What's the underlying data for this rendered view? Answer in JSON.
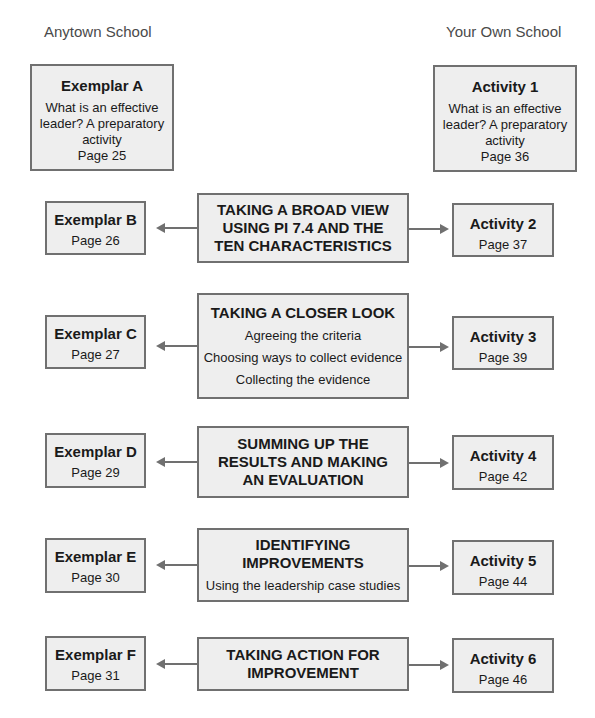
{
  "headers": {
    "left": "Anytown School",
    "right": "Your Own School"
  },
  "top": {
    "left": {
      "title": "Exemplar A",
      "lines": [
        "What is an effective",
        "leader? A preparatory",
        "activity",
        "Page 25"
      ]
    },
    "right": {
      "title": "Activity 1",
      "lines": [
        "What is an effective",
        "leader? A preparatory",
        "activity",
        "Page 36"
      ]
    }
  },
  "rows": [
    {
      "left": {
        "title": "Exemplar B",
        "page": "Page 26"
      },
      "center": {
        "title": [
          "TAKING A BROAD VIEW",
          "USING PI 7.4 AND THE",
          "TEN CHARACTERISTICS"
        ],
        "sub": []
      },
      "right": {
        "title": "Activity 2",
        "page": "Page 37"
      }
    },
    {
      "left": {
        "title": "Exemplar C",
        "page": "Page 27"
      },
      "center": {
        "title": [
          "TAKING A CLOSER LOOK"
        ],
        "sub": [
          "Agreeing the criteria",
          "Choosing ways to collect evidence",
          "Collecting the evidence"
        ]
      },
      "right": {
        "title": "Activity 3",
        "page": "Page 39"
      }
    },
    {
      "left": {
        "title": "Exemplar D",
        "page": "Page 29"
      },
      "center": {
        "title": [
          "SUMMING UP THE",
          "RESULTS AND MAKING",
          "AN EVALUATION"
        ],
        "sub": []
      },
      "right": {
        "title": "Activity 4",
        "page": "Page 42"
      }
    },
    {
      "left": {
        "title": "Exemplar E",
        "page": "Page 30"
      },
      "center": {
        "title": [
          "IDENTIFYING",
          "IMPROVEMENTS"
        ],
        "sub": [
          "Using the leadership case studies"
        ]
      },
      "right": {
        "title": "Activity 5",
        "page": "Page 44"
      }
    },
    {
      "left": {
        "title": "Exemplar F",
        "page": "Page 31"
      },
      "center": {
        "title": [
          "TAKING ACTION FOR",
          "IMPROVEMENT"
        ],
        "sub": []
      },
      "right": {
        "title": "Activity 6",
        "page": "Page 46"
      }
    }
  ]
}
